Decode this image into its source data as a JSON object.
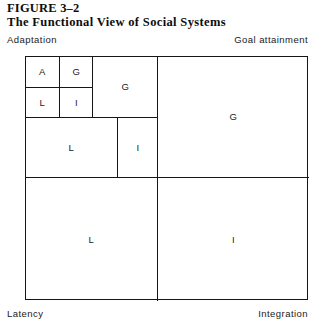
{
  "figure": {
    "number": "FIGURE 3–2",
    "title": "The Functional View of Social Systems"
  },
  "corner_labels": {
    "top_left": "Adaptation",
    "top_right": "Goal attainment",
    "bottom_left": "Latency",
    "bottom_right": "Integration"
  },
  "diagram": {
    "quadrants": {
      "adaptation": "",
      "goal_attainment": "G",
      "latency": "L",
      "integration": "I"
    },
    "adaptation_subcells": {
      "goal_attainment": "G",
      "latency": "L",
      "integration": "I"
    },
    "innermost_cells": {
      "adaptation": "A",
      "goal_attainment": "G",
      "latency": "L",
      "integration": "I"
    }
  },
  "colors": {
    "line": "#16161a",
    "text": "#1a1a1a",
    "background": "#ffffff"
  }
}
